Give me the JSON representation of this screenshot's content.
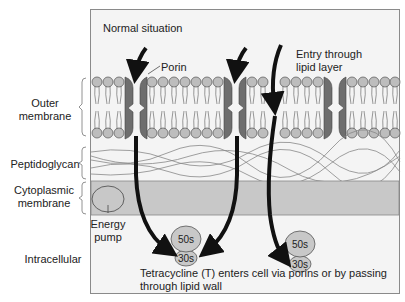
{
  "diagram": {
    "title": "Normal situation",
    "labels": {
      "porin": "Porin",
      "entry_line1": "Entry through",
      "entry_line2": "lipid layer",
      "energy_line1": "Energy",
      "energy_line2": "pump",
      "caption_line1": "Tetracycline (T) enters cell via porins or by passing",
      "caption_line2": "through lipid wall"
    },
    "side_labels": {
      "outer_line1": "Outer",
      "outer_line2": "membrane",
      "peptidoglycan": "Peptidoglycan",
      "cyto_line1": "Cytoplasmic",
      "cyto_line2": "membrane",
      "intracellular": "Intracellular"
    },
    "ribosomes": [
      {
        "large": "50s",
        "small": "30s"
      },
      {
        "large": "50s",
        "small": "30s"
      }
    ],
    "colors": {
      "background": "#f4f4f4",
      "border": "#8a8a8a",
      "lipid_head": "#bdbdbd",
      "porin": "#6e6e6e",
      "cyto_band": "#c8c8c8",
      "arrow": "#111111"
    }
  }
}
